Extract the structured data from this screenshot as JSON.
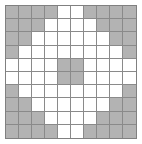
{
  "figure": {
    "kind": "grid-pattern",
    "title": "",
    "background_color": "#ffffff",
    "border_color": "#808080",
    "gridline_color": "#8a8a8a",
    "empty_cell_color": "#ffffff",
    "filled_cell_color": "#b3b3b3"
  },
  "chart_data": {
    "type": "heatmap",
    "title": "",
    "subtitle": "",
    "xlabel": "",
    "ylabel": "",
    "rows": 10,
    "cols": 10,
    "grid": true,
    "legend": "none",
    "legend_entries": [],
    "annotations": [],
    "categories": [
      "1",
      "2",
      "3",
      "4",
      "5",
      "6",
      "7",
      "8",
      "9",
      "10"
    ],
    "row_labels": [
      "1",
      "2",
      "3",
      "4",
      "5",
      "6",
      "7",
      "8",
      "9",
      "10"
    ],
    "value_legend": {
      "0": "empty",
      "1": "filled"
    },
    "values": [
      [
        1,
        1,
        1,
        1,
        0,
        0,
        1,
        1,
        1,
        1
      ],
      [
        1,
        1,
        1,
        0,
        0,
        0,
        0,
        1,
        1,
        1
      ],
      [
        1,
        1,
        0,
        0,
        0,
        0,
        0,
        0,
        1,
        1
      ],
      [
        1,
        0,
        0,
        0,
        0,
        0,
        0,
        0,
        0,
        1
      ],
      [
        0,
        0,
        0,
        0,
        1,
        1,
        0,
        0,
        0,
        0
      ],
      [
        0,
        0,
        0,
        0,
        1,
        1,
        0,
        0,
        0,
        0
      ],
      [
        1,
        0,
        0,
        0,
        0,
        0,
        0,
        0,
        0,
        1
      ],
      [
        1,
        1,
        0,
        0,
        0,
        0,
        0,
        0,
        1,
        1
      ],
      [
        1,
        1,
        1,
        0,
        0,
        0,
        0,
        1,
        1,
        1
      ],
      [
        1,
        1,
        1,
        1,
        0,
        0,
        1,
        1,
        1,
        1
      ]
    ],
    "filled_count": 48,
    "empty_count": 52
  }
}
